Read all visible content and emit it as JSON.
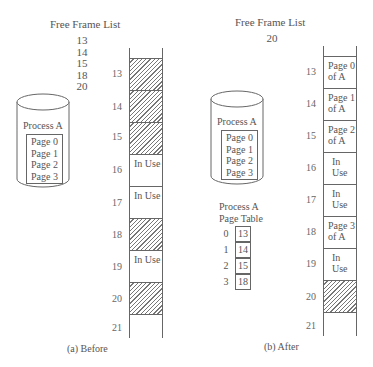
{
  "before": {
    "free_frame_title": "Free Frame List",
    "free_frames": [
      "13",
      "14",
      "15",
      "18",
      "20"
    ],
    "process_label": "Process A",
    "pages": [
      "Page 0",
      "Page 1",
      "Page 2",
      "Page 3"
    ],
    "frames": [
      {
        "num": "13",
        "state": "free",
        "text": ""
      },
      {
        "num": "14",
        "state": "free",
        "text": ""
      },
      {
        "num": "15",
        "state": "free",
        "text": ""
      },
      {
        "num": "16",
        "state": "used",
        "text": "In Use"
      },
      {
        "num": "17",
        "state": "used",
        "text": "In Use"
      },
      {
        "num": "18",
        "state": "free",
        "text": ""
      },
      {
        "num": "19",
        "state": "used",
        "text": "In Use"
      },
      {
        "num": "20",
        "state": "free",
        "text": ""
      },
      {
        "num": "21",
        "state": "empty",
        "text": ""
      }
    ],
    "caption": "(a) Before"
  },
  "after": {
    "free_frame_title": "Free Frame List",
    "free_frames": [
      "20"
    ],
    "process_label": "Process A",
    "pages": [
      "Page 0",
      "Page 1",
      "Page 2",
      "Page 3"
    ],
    "page_table_title": [
      "Process A",
      "Page Table"
    ],
    "page_table": [
      {
        "page": "0",
        "frame": "13"
      },
      {
        "page": "1",
        "frame": "14"
      },
      {
        "page": "2",
        "frame": "15"
      },
      {
        "page": "3",
        "frame": "18"
      }
    ],
    "frames": [
      {
        "num": "13",
        "state": "used",
        "text": "Page 0 of A"
      },
      {
        "num": "14",
        "state": "used",
        "text": "Page 1 of A"
      },
      {
        "num": "15",
        "state": "used",
        "text": "Page 2 of A"
      },
      {
        "num": "16",
        "state": "used",
        "text": "In Use"
      },
      {
        "num": "17",
        "state": "used",
        "text": "In Use"
      },
      {
        "num": "18",
        "state": "used",
        "text": "Page 3 of A"
      },
      {
        "num": "19",
        "state": "used",
        "text": "In Use"
      },
      {
        "num": "20",
        "state": "free",
        "text": ""
      },
      {
        "num": "21",
        "state": "empty",
        "text": ""
      }
    ],
    "caption": "(b) After"
  }
}
